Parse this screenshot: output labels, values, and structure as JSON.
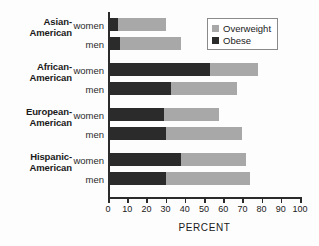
{
  "chart_data": {
    "type": "bar",
    "orientation": "horizontal",
    "stacked": true,
    "title": "",
    "xlabel": "PERCENT",
    "ylabel": "",
    "xlim": [
      0,
      100
    ],
    "xticks": [
      0,
      10,
      20,
      30,
      40,
      50,
      60,
      70,
      80,
      90,
      100
    ],
    "grid": false,
    "legend_position": "top-right",
    "legend": [
      "Overweight",
      "Obese"
    ],
    "colors": {
      "overweight": "#a8a8a8",
      "obese": "#2b2b2b",
      "axis": "#2b2b2b",
      "background": "#fdfdfd"
    },
    "categories": [
      "Asian-American women",
      "Asian-American men",
      "African-American women",
      "African-American men",
      "European-American women",
      "European-American men",
      "Hispanic-American women",
      "Hispanic-American men"
    ],
    "series": [
      {
        "name": "Obese",
        "values": [
          5,
          6,
          53,
          33,
          29,
          30,
          38,
          30
        ]
      },
      {
        "name": "Overweight",
        "values": [
          25,
          32,
          25,
          34,
          29,
          40,
          34,
          44
        ]
      }
    ],
    "totals": [
      30,
      38,
      78,
      67,
      58,
      70,
      72,
      74
    ],
    "groups": [
      {
        "label_line1": "Asian-",
        "label_line2": "American",
        "rows": [
          {
            "sex": "women",
            "obese": 5,
            "total": 30
          },
          {
            "sex": "men",
            "obese": 6,
            "total": 38
          }
        ]
      },
      {
        "label_line1": "African-",
        "label_line2": "American",
        "rows": [
          {
            "sex": "women",
            "obese": 53,
            "total": 78
          },
          {
            "sex": "men",
            "obese": 33,
            "total": 67
          }
        ]
      },
      {
        "label_line1": "European-",
        "label_line2": "American",
        "rows": [
          {
            "sex": "women",
            "obese": 29,
            "total": 58
          },
          {
            "sex": "men",
            "obese": 30,
            "total": 70
          }
        ]
      },
      {
        "label_line1": "Hispanic-",
        "label_line2": "American",
        "rows": [
          {
            "sex": "women",
            "obese": 38,
            "total": 72
          },
          {
            "sex": "men",
            "obese": 30,
            "total": 74
          }
        ]
      }
    ]
  }
}
